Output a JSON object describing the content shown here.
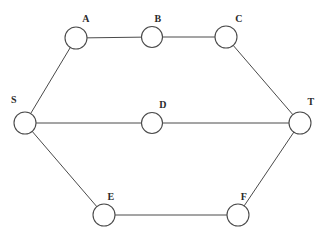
{
  "diagram": {
    "background_color": "#ffffff",
    "stroke_color": "#4a4a4a",
    "label_color": "#2b2b2b",
    "node_radius": 11,
    "width": 326,
    "height": 242
  },
  "chart_data": {
    "type": "diagram",
    "graph_type": "undirected-graph",
    "nodes": [
      {
        "id": "S",
        "label": "S",
        "x": 25,
        "y": 123,
        "r": 11,
        "label_x": 14,
        "label_y": 100
      },
      {
        "id": "A",
        "label": "A",
        "x": 76,
        "y": 38,
        "r": 11,
        "label_x": 86,
        "label_y": 19
      },
      {
        "id": "B",
        "label": "B",
        "x": 152,
        "y": 37,
        "r": 10.5,
        "label_x": 158,
        "label_y": 19
      },
      {
        "id": "C",
        "label": "C",
        "x": 226,
        "y": 37,
        "r": 11,
        "label_x": 239,
        "label_y": 19
      },
      {
        "id": "T",
        "label": "T",
        "x": 300,
        "y": 123,
        "r": 11,
        "label_x": 311,
        "label_y": 102
      },
      {
        "id": "D",
        "label": "D",
        "x": 152,
        "y": 123,
        "r": 10.5,
        "label_x": 163,
        "label_y": 105
      },
      {
        "id": "E",
        "label": "E",
        "x": 104,
        "y": 215,
        "r": 11,
        "label_x": 111,
        "label_y": 197
      },
      {
        "id": "F",
        "label": "F",
        "x": 238,
        "y": 215,
        "r": 11,
        "label_x": 244,
        "label_y": 197
      }
    ],
    "edges": [
      {
        "from": "S",
        "to": "A"
      },
      {
        "from": "A",
        "to": "B"
      },
      {
        "from": "B",
        "to": "C"
      },
      {
        "from": "C",
        "to": "T"
      },
      {
        "from": "S",
        "to": "D"
      },
      {
        "from": "D",
        "to": "T"
      },
      {
        "from": "S",
        "to": "E"
      },
      {
        "from": "E",
        "to": "F"
      },
      {
        "from": "F",
        "to": "T"
      }
    ],
    "paths": [
      [
        "S",
        "A",
        "B",
        "C",
        "T"
      ],
      [
        "S",
        "D",
        "T"
      ],
      [
        "S",
        "E",
        "F",
        "T"
      ]
    ]
  }
}
